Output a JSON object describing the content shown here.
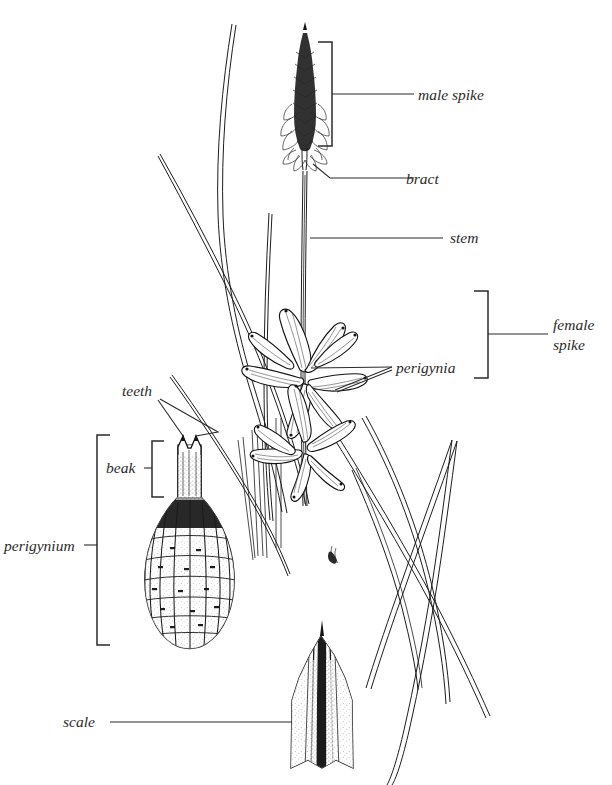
{
  "figure": {
    "kind": "botanical-line-drawing",
    "background_color": "#ffffff",
    "ink_color": "#1a1a1a",
    "width": 612,
    "height": 785
  },
  "labels": {
    "male_spike": "male spike",
    "bract": "bract",
    "stem": "stem",
    "female_spike_line1": "female",
    "female_spike_line2": "spike",
    "perigynia": "perigynia",
    "teeth": "teeth",
    "beak": "beak",
    "perigynium": "perigynium",
    "scale": "scale"
  },
  "annotations": [
    {
      "id": "male-spike",
      "text": "male spike",
      "connector": "bracket",
      "side": "right"
    },
    {
      "id": "bract",
      "text": "bract",
      "connector": "leader-line",
      "side": "right"
    },
    {
      "id": "stem",
      "text": "stem",
      "connector": "leader-line",
      "side": "right"
    },
    {
      "id": "female-spike",
      "text": "female spike",
      "connector": "bracket",
      "side": "right"
    },
    {
      "id": "perigynia",
      "text": "perigynia",
      "connector": "double-leader-line",
      "side": "right"
    },
    {
      "id": "teeth",
      "text": "teeth",
      "connector": "double-leader-line",
      "side": "left"
    },
    {
      "id": "beak",
      "text": "beak",
      "connector": "bracket",
      "side": "left"
    },
    {
      "id": "perigynium",
      "text": "perigynium",
      "connector": "bracket",
      "side": "left"
    },
    {
      "id": "scale",
      "text": "scale",
      "connector": "leader-line",
      "side": "left"
    }
  ],
  "parts": {
    "male_spike": "narrow dark terminal spike of overlapping staminate scales",
    "bract": "small subtending bract at base of male spike",
    "stem": "slender erect culm",
    "female_spikes": "two star-shaped clusters of spreading perigynia",
    "perigynium_detail": "enlarged pear-shaped perigynium with strong vertical ribs, tapering beak and two apical teeth",
    "scale_detail": "enlarged ovate pistillate scale with dark midrib"
  }
}
